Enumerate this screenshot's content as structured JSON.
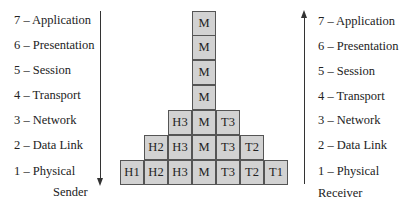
{
  "sender": {
    "layers": [
      "7 – Application",
      "6 – Presentation",
      "5 – Session",
      "4 – Transport",
      "3 – Network",
      "2 – Data Link",
      "1 – Physical"
    ],
    "caption": "Sender",
    "arrow_direction": "down"
  },
  "receiver": {
    "layers": [
      "7 – Application",
      "6 – Presentation",
      "5 – Session",
      "4 – Transport",
      "3 – Network",
      "2 – Data Link",
      "1 – Physical"
    ],
    "caption": "Receiver",
    "arrow_direction": "up"
  },
  "pyramid": {
    "rows": [
      [
        "M"
      ],
      [
        "M"
      ],
      [
        "M"
      ],
      [
        "M"
      ],
      [
        "H3",
        "M",
        "T3"
      ],
      [
        "H2",
        "H3",
        "M",
        "T3",
        "T2"
      ],
      [
        "H1",
        "H2",
        "H3",
        "M",
        "T3",
        "T2",
        "T1"
      ]
    ],
    "cell_fill": "#d2d2d2",
    "cell_border": "#555555"
  }
}
